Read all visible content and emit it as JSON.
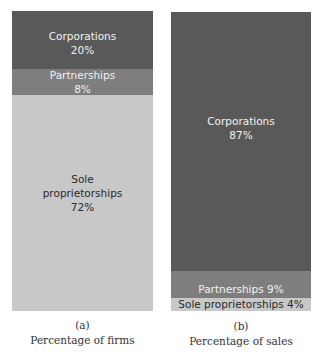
{
  "chart_data": [
    {
      "type": "bar",
      "stacked": true,
      "title": "Percentage of firms",
      "panel_label": "(a)",
      "segments": [
        {
          "name": "Corporations",
          "value": 20,
          "label_lines": [
            "Corporations",
            "20%"
          ],
          "color": "#595959",
          "text_style": "dark",
          "height_px": 58
        },
        {
          "name": "Partnerships",
          "value": 8,
          "label_lines": [
            "Partnerships",
            "8%"
          ],
          "color": "#7e7e7e",
          "text_style": "dark",
          "height_px": 26
        },
        {
          "name": "Sole proprietorships",
          "value": 72,
          "label_lines": [
            "Sole",
            "proprietorships",
            "72%"
          ],
          "color": "#c8c8c8",
          "text_style": "light",
          "height_px": 216
        }
      ],
      "ylim": [
        0,
        100
      ],
      "grid": false
    },
    {
      "type": "bar",
      "stacked": true,
      "title": "Percentage of sales",
      "panel_label": "(b)",
      "segments": [
        {
          "name": "Corporations",
          "value": 87,
          "label_lines": [
            "Corporations",
            "87%"
          ],
          "color": "#595959",
          "text_style": "dark",
          "height_px": 259
        },
        {
          "name": "Partnerships",
          "value": 9,
          "label_lines": [
            "Partnerships 9%"
          ],
          "color": "#7e7e7e",
          "text_style": "dark",
          "height_px": 27
        },
        {
          "name": "Sole proprietorships",
          "value": 4,
          "label_lines": [
            "Sole proprietorships 4%"
          ],
          "color": "#c8c8c8",
          "text_style": "light",
          "height_px": 13
        }
      ],
      "ylim": [
        0,
        100
      ],
      "grid": false
    }
  ],
  "captions": {
    "a": {
      "label": "(a)",
      "title": "Percentage of firms"
    },
    "b": {
      "label": "(b)",
      "title": "Percentage of sales"
    }
  }
}
